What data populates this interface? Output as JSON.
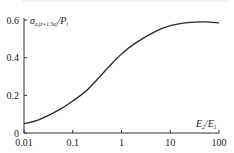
{
  "chart_data": {
    "type": "line",
    "title": "",
    "xlabel": "E2/E1",
    "xlabel_parts": {
      "main": "E",
      "sub1": "2",
      "sep": "/E",
      "sub2": "1"
    },
    "ylabel": "σz,(z=1.5a)/Pi",
    "ylabel_parts": {
      "main": "σ",
      "sub": "z,(z=1.5a)",
      "sep": "/P",
      "sub2": "i"
    },
    "xscale": "log",
    "xlim": [
      0.01,
      100
    ],
    "ylim": [
      0,
      0.6
    ],
    "xticks": [
      0.01,
      0.1,
      1,
      10,
      100
    ],
    "xtick_labels": [
      "0.01",
      "0.1",
      "1",
      "10",
      "100"
    ],
    "yticks": [
      0,
      0.2,
      0.4,
      0.6
    ],
    "ytick_labels": [
      "0",
      "0.2",
      "0.4",
      "0.6"
    ],
    "grid": false,
    "legend": "none",
    "series": [
      {
        "name": "σz/Pi",
        "x": [
          0.01,
          0.02,
          0.05,
          0.1,
          0.2,
          0.5,
          1,
          2,
          5,
          10,
          20,
          50,
          100
        ],
        "y": [
          0.05,
          0.07,
          0.12,
          0.17,
          0.23,
          0.34,
          0.42,
          0.48,
          0.54,
          0.57,
          0.585,
          0.59,
          0.585
        ]
      }
    ]
  }
}
